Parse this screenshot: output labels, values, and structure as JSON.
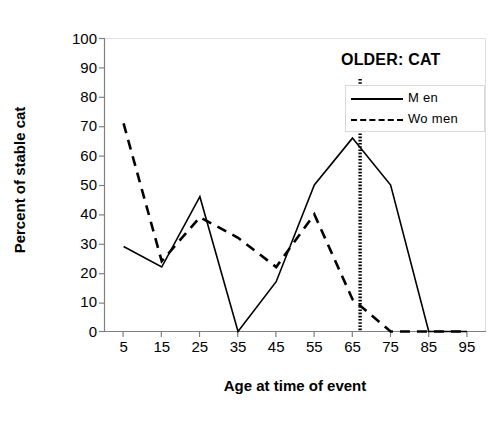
{
  "chart_data": {
    "type": "line",
    "title": "",
    "annotation": "OLDER: CAT",
    "xlabel": "Age at time of event",
    "ylabel": "Percent of stable cat",
    "categories": [
      5,
      15,
      25,
      35,
      45,
      55,
      65,
      75,
      85,
      95
    ],
    "x_tick_labels": [
      "5",
      "15",
      "25",
      "35",
      "45",
      "55",
      "65",
      "75",
      "85",
      "95"
    ],
    "y_tick_labels": [
      "100",
      "90",
      "80",
      "70",
      "60",
      "50",
      "40",
      "30",
      "20",
      "10",
      "0"
    ],
    "y_ticks": [
      100,
      90,
      80,
      70,
      60,
      50,
      40,
      30,
      20,
      10,
      0
    ],
    "ylim": [
      0,
      100
    ],
    "xlim": [
      5,
      95
    ],
    "grid": false,
    "legend_position": "top-right",
    "series": [
      {
        "name": "Men",
        "style": "solid",
        "color": "#000000",
        "values": [
          29,
          22,
          46,
          0,
          17,
          50,
          66,
          50,
          0,
          0
        ]
      },
      {
        "name": "Women",
        "style": "dashed",
        "color": "#000000",
        "values": [
          71,
          24,
          39,
          32,
          22,
          40,
          11,
          0,
          0,
          0
        ]
      }
    ],
    "vertical_marker": {
      "label": "OLDER: CAT",
      "x_value": 67,
      "style": "dotted-thick",
      "color": "#000000"
    }
  },
  "legend": {
    "items": [
      {
        "label": "M en",
        "style": "solid"
      },
      {
        "label": "Wo men",
        "style": "dashed"
      }
    ]
  },
  "axes": {
    "x_title": "Age at time of event",
    "y_title": "Percent of stable cat"
  }
}
